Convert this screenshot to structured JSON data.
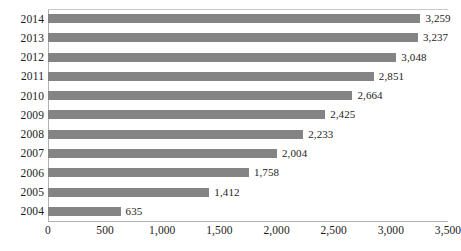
{
  "chart_data": {
    "type": "bar",
    "orientation": "horizontal",
    "title": "",
    "subtitle": "",
    "xlabel": "",
    "ylabel": "",
    "categories": [
      "2014",
      "2013",
      "2012",
      "2011",
      "2010",
      "2009",
      "2008",
      "2007",
      "2006",
      "2005",
      "2004"
    ],
    "values": [
      3259,
      3237,
      3048,
      2851,
      2664,
      2425,
      2233,
      2004,
      1758,
      1412,
      635
    ],
    "value_labels": [
      "3,259",
      "3,237",
      "3,048",
      "2,851",
      "2,664",
      "2,425",
      "2,233",
      "2,004",
      "1,758",
      "1,412",
      "635"
    ],
    "xlim": [
      0,
      3500
    ],
    "xticks": [
      0,
      500,
      1000,
      1500,
      2000,
      2500,
      3000,
      3500
    ],
    "xtick_labels": [
      "0",
      "500",
      "1,000",
      "1,500",
      "2,000",
      "2,500",
      "3,000",
      "3,500"
    ],
    "grid": false,
    "legend": null,
    "legend_position": "none",
    "bar_color": "#848484",
    "axis_color": "#b0b0b0",
    "label_color": "#1c1c1c",
    "background": "#ffffff"
  }
}
